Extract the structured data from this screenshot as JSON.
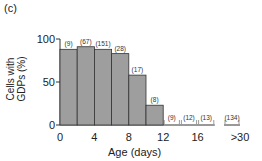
{
  "panel_label": "(c)",
  "chart_data": {
    "type": "bar",
    "title": "",
    "xlabel": "Age (days)",
    "ylabel": "Cells with GDPs (%)",
    "ylim": [
      0,
      100
    ],
    "yticks": [
      0,
      50,
      100
    ],
    "xticks": [
      "0",
      "4",
      "8",
      "12",
      "16",
      ">30"
    ],
    "grid": false,
    "bin_width_days": 2,
    "categories": [
      "0-2",
      "2-4",
      "4-6",
      "6-8",
      "8-10",
      "10-12",
      "12-14",
      "14-16",
      "16-18",
      ">30"
    ],
    "values": [
      88,
      91,
      88,
      83,
      58,
      23,
      0,
      0,
      0,
      0
    ],
    "n_labels": [
      "(9)",
      "(67)",
      "(151)",
      "(28)",
      "(17)",
      "(8)",
      "(9)",
      "(12)",
      "(13)",
      "(134)"
    ],
    "bar_color": "#9e9e9e",
    "edge_color": "#333333"
  }
}
